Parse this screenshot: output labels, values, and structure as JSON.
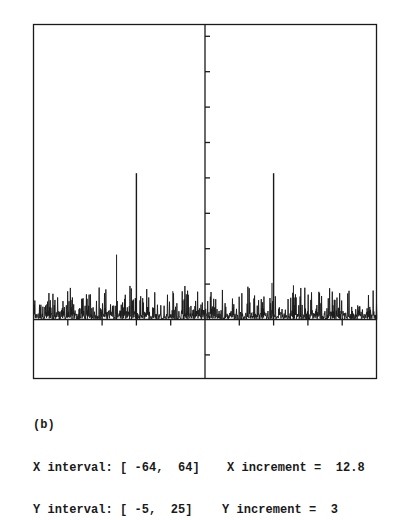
{
  "figure": {
    "label": "(b)",
    "x_interval_label": "X interval: [ -64,  64]",
    "y_interval_label": "Y interval: [ -5,  25]",
    "x_increment_label": "X increment =  12.8",
    "y_increment_label": "Y increment =  3"
  },
  "colors": {
    "background": "#ffffff",
    "ink": "#1a1a1a"
  },
  "chart_data": {
    "type": "line",
    "title": "(b)",
    "xlabel": "",
    "ylabel": "",
    "xlim": [
      -64,
      64
    ],
    "ylim": [
      -5,
      25
    ],
    "x_increment": 12.8,
    "y_increment": 3,
    "grid": false,
    "legend": null,
    "axes_through_origin": true,
    "x_ticks": [
      -51.2,
      -38.4,
      -25.6,
      -12.8,
      12.8,
      25.6,
      38.4,
      51.2
    ],
    "y_ticks": [
      -3,
      3,
      6,
      9,
      12,
      15,
      18,
      21,
      24
    ],
    "series": [
      {
        "name": "spectrum",
        "description": "Noisy baseline (approx. 0 to 2.5) with two symmetric sharp spikes",
        "peaks": [
          {
            "x": -25.6,
            "y": 12.4
          },
          {
            "x": 25.6,
            "y": 12.4
          }
        ],
        "secondary_peaks": [
          {
            "x": -33,
            "y": 5.5
          },
          {
            "x": -12,
            "y": 2.4
          },
          {
            "x": 25.0,
            "y": 3.1
          },
          {
            "x": 33,
            "y": 2.9
          }
        ],
        "noise_range": [
          0,
          2.5
        ]
      }
    ]
  }
}
